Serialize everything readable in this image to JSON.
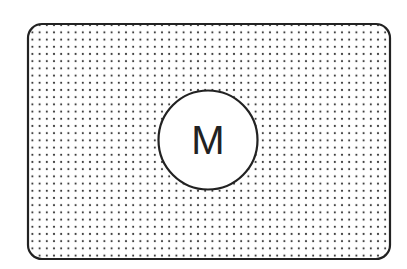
{
  "diagram": {
    "type": "stippled-region-with-node",
    "region": {
      "shape": "rounded-rectangle",
      "fill_pattern": "dots",
      "border_color": "#222222",
      "dot_color": "#333333"
    },
    "node": {
      "shape": "circle",
      "label": "M",
      "fill": "#ffffff",
      "border_color": "#222222"
    }
  }
}
